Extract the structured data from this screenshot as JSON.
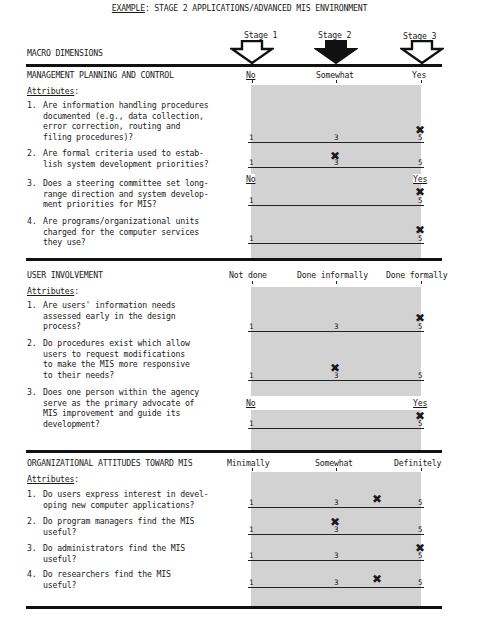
{
  "header": {
    "example_label": "EXAMPLE",
    "title_rest": ":  STAGE 2 APPLICATIONS/ADVANCED MIS ENVIRONMENT",
    "macro_dimensions": "MACRO DIMENSIONS",
    "stages": [
      {
        "label": "Stage 1",
        "arrow": "hollow-down-arrow",
        "highlighted": false
      },
      {
        "label": "Stage 2",
        "arrow": "filled-down-arrow",
        "highlighted": true
      },
      {
        "label": "Stage 3",
        "arrow": "hollow-down-arrow",
        "highlighted": false
      }
    ]
  },
  "scale": {
    "min": "1",
    "mid": "3",
    "max": "5"
  },
  "sections": [
    {
      "title": "MANAGEMENT PLANNING AND CONTROL",
      "attributes_label": "Attributes",
      "anchors": [
        "No",
        "Somewhat",
        "Yes"
      ],
      "questions": [
        {
          "num": "1.",
          "text": "Are information handling procedures\ndocumented (e.g., data collection,\nerror correction, routing and\nfiling procedures)?",
          "rating": 5
        },
        {
          "num": "2.",
          "text": "Are formal criteria used to estab-\nlish system development priorities?",
          "rating": 3
        },
        {
          "num": "3.",
          "text": "Does a steering committee set long-\nrange direction and system develop-\nment priorities for MIS?",
          "rating": 5,
          "anchors": [
            "No",
            "Yes"
          ]
        },
        {
          "num": "4.",
          "text": "Are programs/organizational units\ncharged for the computer services\nthey use?",
          "rating": 5
        }
      ]
    },
    {
      "title": "USER INVOLVEMENT",
      "attributes_label": "Attributes",
      "anchors": [
        "Not done",
        "Done informally",
        "Done formally"
      ],
      "questions": [
        {
          "num": "1.",
          "text": "Are users' information needs\nassessed early in the design\nprocess?",
          "rating": 5
        },
        {
          "num": "2.",
          "text": "Do procedures exist which allow\nusers to request modifications\nto make the MIS more responsive\nto their needs?",
          "rating": 3
        },
        {
          "num": "3.",
          "text": "Does one person within the agency\nserve as the primary advocate of\nMIS improvement and guide its\ndevelopment?",
          "rating": 5,
          "anchors": [
            "No",
            "Yes"
          ]
        }
      ]
    },
    {
      "title": "ORGANIZATIONAL ATTITUDES TOWARD MIS",
      "attributes_label": "Attributes",
      "anchors": [
        "Minimally",
        "Somewhat",
        "Definitely"
      ],
      "questions": [
        {
          "num": "1.",
          "text": "Do users express interest in devel-\noping new computer applications?",
          "rating": 4
        },
        {
          "num": "2.",
          "text": "Do program managers find the MIS\nuseful?",
          "rating": 3
        },
        {
          "num": "3.",
          "text": "Do administrators find the MIS\nuseful?",
          "rating": 5
        },
        {
          "num": "4.",
          "text": "Do researchers find the MIS\nuseful?",
          "rating": 4
        }
      ]
    }
  ],
  "mark_glyph": "✖"
}
